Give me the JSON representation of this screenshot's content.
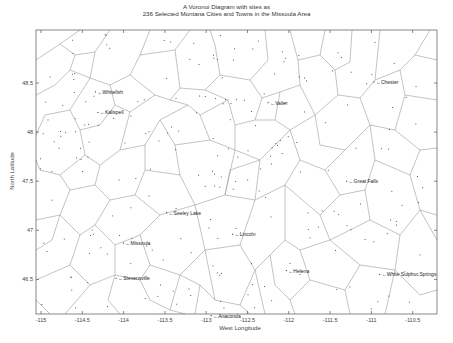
{
  "chart_data": {
    "type": "scatter",
    "subtype": "voronoi",
    "title": "A Voronoi Diagram with sites as",
    "subtitle": "236 Selected Montana Cities and Towns in the Missoula Area",
    "xlabel": "West Longitude",
    "ylabel": "North Latitude",
    "xlim": [
      -115.05,
      -110.3
    ],
    "ylim": [
      46.14,
      49.04
    ],
    "grid": false,
    "legend": null,
    "x_ticks": [
      -115,
      -114.5,
      -114,
      -113.5,
      -113,
      -112.5,
      -112,
      -111.5,
      -111,
      -110.5
    ],
    "x_tick_labels": [
      "-115",
      "-114.5",
      "-114",
      "-113.5",
      "-113",
      "-112.5",
      "-112",
      "-111.5",
      "-111",
      "-110.5"
    ],
    "y_ticks": [
      48.5,
      48,
      47.5,
      47,
      46.5
    ],
    "y_tick_labels": [
      "48.5",
      "48",
      "47.5",
      "47",
      "46.5"
    ],
    "site_count": 236,
    "labeled_cities": [
      {
        "name": "Whitefish",
        "lon": -114.34,
        "lat": 48.41
      },
      {
        "name": "Kalispell",
        "lon": -114.31,
        "lat": 48.2
      },
      {
        "name": "Valier",
        "lon": -112.25,
        "lat": 48.3
      },
      {
        "name": "Chester",
        "lon": -110.97,
        "lat": 48.51
      },
      {
        "name": "Great Falls",
        "lon": -111.3,
        "lat": 47.5
      },
      {
        "name": "Seeley Lake",
        "lon": -113.48,
        "lat": 47.18
      },
      {
        "name": "Lincoln",
        "lon": -112.68,
        "lat": 46.96
      },
      {
        "name": "Missoula",
        "lon": -114.0,
        "lat": 46.87
      },
      {
        "name": "Helena",
        "lon": -112.03,
        "lat": 46.59
      },
      {
        "name": "White Sulphur Springs",
        "lon": -110.9,
        "lat": 46.55
      },
      {
        "name": "Stevensville",
        "lon": -114.09,
        "lat": 46.51
      },
      {
        "name": "Anaconda",
        "lon": -112.94,
        "lat": 46.13
      }
    ]
  },
  "figure": {
    "title_line1": "A Voronoi Diagram with sites as",
    "title_line2": "236 Selected Montana Cities and Towns in the Missoula Area",
    "xlabel": "West Longitude",
    "ylabel": "North Latitude"
  },
  "colors": {
    "edges": "#9a9a9a",
    "axes": "#555555",
    "sites": "#333333",
    "labels": "#222222"
  }
}
